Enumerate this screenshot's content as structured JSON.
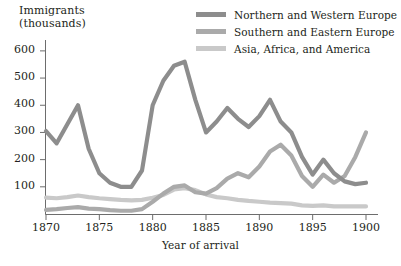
{
  "chart_data": {
    "type": "line",
    "title": "",
    "ylabel": "Immigrants\n(thousands)",
    "xlabel": "Year of arrival",
    "xlim": [
      1870,
      1900
    ],
    "ylim": [
      0,
      640
    ],
    "xticks": [
      1870,
      1875,
      1880,
      1885,
      1890,
      1895,
      1900
    ],
    "yticks": [
      100,
      200,
      300,
      400,
      500,
      600
    ],
    "grid": false,
    "legend_position": "top-right",
    "x": [
      1870,
      1871,
      1872,
      1873,
      1874,
      1875,
      1876,
      1877,
      1878,
      1879,
      1880,
      1881,
      1882,
      1883,
      1884,
      1885,
      1886,
      1887,
      1888,
      1889,
      1890,
      1891,
      1892,
      1893,
      1894,
      1895,
      1896,
      1897,
      1898,
      1899,
      1900
    ],
    "series": [
      {
        "name": "Northern and Western Europe",
        "color": "#8d8d8d",
        "values": [
          305,
          260,
          330,
          400,
          240,
          150,
          115,
          100,
          100,
          160,
          400,
          490,
          545,
          560,
          420,
          300,
          340,
          390,
          350,
          320,
          360,
          420,
          340,
          300,
          210,
          145,
          200,
          150,
          120,
          110,
          115
        ]
      },
      {
        "name": "Southern and Eastern Europe",
        "color": "#aaaaaa",
        "values": [
          15,
          18,
          22,
          25,
          20,
          18,
          14,
          12,
          12,
          18,
          45,
          75,
          100,
          105,
          80,
          75,
          95,
          130,
          150,
          135,
          175,
          230,
          255,
          215,
          140,
          100,
          145,
          115,
          140,
          210,
          300
        ]
      },
      {
        "name": "Asia, Africa, and America",
        "color": "#c9c9c9",
        "values": [
          60,
          58,
          62,
          68,
          62,
          58,
          55,
          52,
          50,
          52,
          60,
          70,
          90,
          95,
          88,
          72,
          62,
          58,
          52,
          48,
          45,
          42,
          40,
          38,
          32,
          30,
          32,
          28,
          28,
          28,
          28
        ]
      }
    ]
  },
  "legend": {
    "items": [
      {
        "label": "Northern and Western Europe",
        "color": "#8d8d8d"
      },
      {
        "label": "Southern and Eastern Europe",
        "color": "#aaaaaa"
      },
      {
        "label": "Asia, Africa, and America",
        "color": "#c9c9c9"
      }
    ]
  },
  "axes": {
    "y_title": "Immigrants\n(thousands)",
    "x_title": "Year of arrival",
    "y_tick_labels": [
      "600",
      "500",
      "400",
      "300",
      "200",
      "100"
    ],
    "x_tick_labels": [
      "1870",
      "1875",
      "1880",
      "1885",
      "1890",
      "1895",
      "1900"
    ]
  }
}
